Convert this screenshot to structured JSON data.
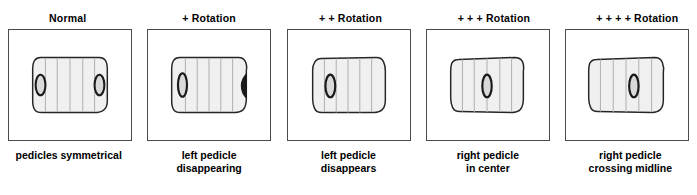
{
  "figure": {
    "panel_count": 5
  },
  "panels": [
    {
      "heading": "Normal",
      "caption": "pedicles symmetrical",
      "left_pedicle": "visible-left-margin",
      "right_pedicle": "visible-right-margin"
    },
    {
      "heading": "+ Rotation",
      "caption": "left pedicle\ndisappearing",
      "left_pedicle": "moved-inward",
      "right_pedicle": "crescent-at-right-edge"
    },
    {
      "heading": "+ + Rotation",
      "caption": "left pedicle\ndisappears",
      "left_pedicle": "absent",
      "right_pedicle": "left-of-center"
    },
    {
      "heading": "+ + + Rotation",
      "caption": "right pedicle\nin center",
      "left_pedicle": "absent",
      "right_pedicle": "center"
    },
    {
      "heading": "+ + + + Rotation",
      "caption": "right pedicle\ncrossing midline",
      "left_pedicle": "absent",
      "right_pedicle": "past-midline"
    }
  ],
  "colors": {
    "frame_border": "#4a4a4a",
    "vertebra_outline": "#262626",
    "vertebra_fill": "#f0f0f0",
    "stripe_line": "#b4b4b4",
    "pedicle_outline": "#1a1a1a",
    "pedicle_fill": "#d9d9d9",
    "text": "#000000",
    "background": "#ffffff"
  }
}
